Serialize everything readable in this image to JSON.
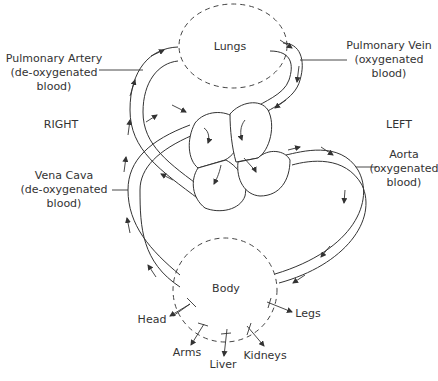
{
  "diagram": {
    "organs": {
      "lungs": "Lungs",
      "body": "Body"
    },
    "sides": {
      "right": "RIGHT",
      "left": "LEFT"
    },
    "vessels": {
      "pulmonary_artery": {
        "line1": "Pulmonary Artery",
        "line2": "(de-oxygenated",
        "line3": "blood)"
      },
      "pulmonary_vein": {
        "line1": "Pulmonary Vein",
        "line2": "(oxygenated",
        "line3": "blood)"
      },
      "vena_cava": {
        "line1": "Vena Cava",
        "line2": "(de-oxygenated",
        "line3": "blood)"
      },
      "aorta": {
        "line1": "Aorta",
        "line2": "(oxygenated",
        "line3": "blood)"
      }
    },
    "body_parts": {
      "head": "Head",
      "arms": "Arms",
      "liver": "Liver",
      "kidneys": "Kidneys",
      "legs": "Legs"
    },
    "colors": {
      "line": "#333333",
      "background": "#ffffff"
    }
  }
}
